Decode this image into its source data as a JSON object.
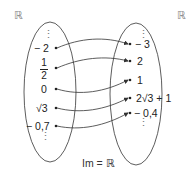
{
  "domain_label": "ℝ",
  "codomain_label": "ℝ",
  "caption": "Im = ℝ",
  "domain_values": [
    {
      "id": "minus2",
      "text": "− 2"
    },
    {
      "id": "half",
      "num": "1",
      "den": "2"
    },
    {
      "id": "zero",
      "text": "0"
    },
    {
      "id": "sqrt3",
      "text": "√3"
    },
    {
      "id": "minus07",
      "text": "− 0,7"
    }
  ],
  "image_values": [
    {
      "id": "minus3",
      "text": "− 3"
    },
    {
      "id": "two",
      "text": "2"
    },
    {
      "id": "one",
      "text": "1"
    },
    {
      "id": "twosqrt3plus1",
      "text": "2√3 + 1"
    },
    {
      "id": "minus04",
      "text": "− 0,4"
    }
  ],
  "mapping": [
    [
      "− 2",
      "− 3"
    ],
    [
      "1/2",
      "2"
    ],
    [
      "0",
      "1"
    ],
    [
      "√3",
      "2√3 + 1"
    ],
    [
      "− 0,7",
      "− 0,4"
    ]
  ],
  "ellipsis": "⋮",
  "colors": {
    "stroke": "#333333",
    "set_label": "#888888"
  }
}
